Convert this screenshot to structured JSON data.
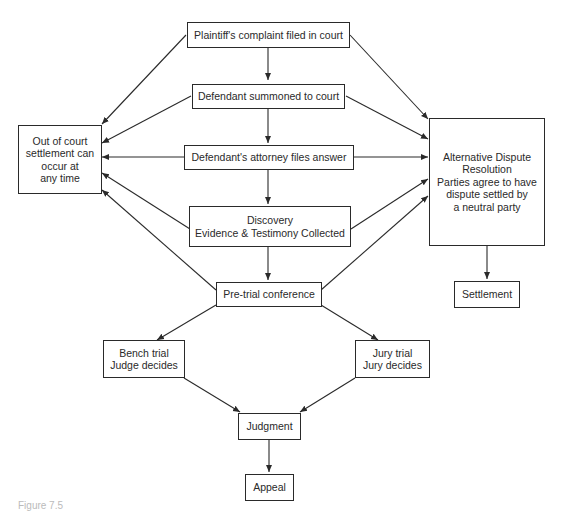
{
  "diagram": {
    "type": "flowchart",
    "nodes": {
      "complaint": {
        "lines": [
          "Plaintiff's complaint filed in court"
        ]
      },
      "summoned": {
        "lines": [
          "Defendant summoned to court"
        ]
      },
      "answer": {
        "lines": [
          "Defendant's attorney files answer"
        ]
      },
      "discovery": {
        "lines": [
          "Discovery",
          "Evidence & Testimony Collected"
        ]
      },
      "pretrial": {
        "lines": [
          "Pre-trial conference"
        ]
      },
      "out_of_court": {
        "lines": [
          "Out of court",
          "settlement can",
          "occur at",
          "any time"
        ]
      },
      "adr": {
        "lines": [
          "Alternative Dispute",
          "Resolution",
          "Parties agree to have",
          "dispute settled by",
          "a neutral party"
        ]
      },
      "settlement": {
        "lines": [
          "Settlement"
        ]
      },
      "bench": {
        "lines": [
          "Bench trial",
          "Judge decides"
        ]
      },
      "jury": {
        "lines": [
          "Jury trial",
          "Jury decides"
        ]
      },
      "judgment": {
        "lines": [
          "Judgment"
        ]
      },
      "appeal": {
        "lines": [
          "Appeal"
        ]
      }
    },
    "edges": [
      [
        "complaint",
        "summoned"
      ],
      [
        "summoned",
        "answer"
      ],
      [
        "answer",
        "discovery"
      ],
      [
        "discovery",
        "pretrial"
      ],
      [
        "pretrial",
        "bench"
      ],
      [
        "pretrial",
        "jury"
      ],
      [
        "bench",
        "judgment"
      ],
      [
        "jury",
        "judgment"
      ],
      [
        "judgment",
        "appeal"
      ],
      [
        "adr",
        "settlement"
      ],
      [
        "complaint",
        "out_of_court"
      ],
      [
        "summoned",
        "out_of_court"
      ],
      [
        "answer",
        "out_of_court"
      ],
      [
        "discovery",
        "out_of_court"
      ],
      [
        "pretrial",
        "out_of_court"
      ],
      [
        "complaint",
        "adr"
      ],
      [
        "summoned",
        "adr"
      ],
      [
        "answer",
        "adr"
      ],
      [
        "discovery",
        "adr"
      ],
      [
        "pretrial",
        "adr"
      ]
    ]
  },
  "caption": "Figure 7.5"
}
